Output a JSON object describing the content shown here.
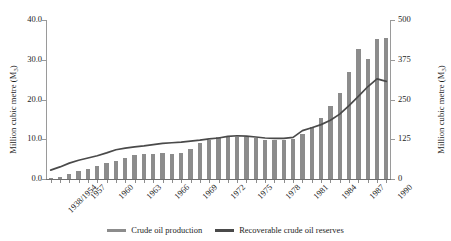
{
  "chart_data": {
    "type": "bar",
    "title": "",
    "xlabel": "",
    "ylabel": "Million cubic metre (M",
    "ylabel_sub": "3",
    "ylabel_suffix": ")",
    "y2label": "Million cubic metre (M",
    "y2label_sub": "3",
    "y2label_suffix": ")",
    "grid": false,
    "legend_position": "bottom",
    "ylim": [
      0,
      40
    ],
    "y2lim": [
      0,
      500
    ],
    "yticks": [
      "0.0",
      "10.0",
      "20.0",
      "30.0",
      "40.0"
    ],
    "ytick_values": [
      0,
      10,
      20,
      30,
      40
    ],
    "y2ticks": [
      "0",
      "125",
      "250",
      "375",
      "500"
    ],
    "y2tick_values": [
      0,
      125,
      250,
      375,
      500
    ],
    "categories": [
      "1938/1954",
      "1955",
      "1956",
      "1957",
      "1958",
      "1959",
      "1960",
      "1961",
      "1962",
      "1963",
      "1964",
      "1965",
      "1966",
      "1967",
      "1968",
      "1969",
      "1970",
      "1971",
      "1972",
      "1973",
      "1974",
      "1975",
      "1976",
      "1977",
      "1978",
      "1979",
      "1980",
      "1981",
      "1982",
      "1983",
      "1984",
      "1985",
      "1986",
      "1987",
      "1988",
      "1989",
      "1990"
    ],
    "xtick_labels": [
      "1938/1954",
      "1957",
      "1960",
      "1963",
      "1966",
      "1969",
      "1972",
      "1975",
      "1978",
      "1981",
      "1984",
      "1987",
      "1990"
    ],
    "xtick_indices": [
      0,
      3,
      6,
      9,
      12,
      15,
      18,
      21,
      24,
      27,
      30,
      33,
      36
    ],
    "series": [
      {
        "name": "Crude oil production",
        "kind": "bar",
        "axis": "left",
        "color": "#8c8c8c",
        "values": [
          0.3,
          0.6,
          1.2,
          2.0,
          2.6,
          3.3,
          4.1,
          4.6,
          5.3,
          6.0,
          6.2,
          6.4,
          6.5,
          6.4,
          6.6,
          7.6,
          9.1,
          9.8,
          10.5,
          10.6,
          10.6,
          10.5,
          10.2,
          9.8,
          9.7,
          9.8,
          10.1,
          11.4,
          13.2,
          15.3,
          18.3,
          21.6,
          26.9,
          32.8,
          30.2,
          35.3,
          35.5
        ]
      },
      {
        "name": "Recoverable crude oil reserves",
        "kind": "line",
        "axis": "right",
        "color": "#4a4a4a",
        "values": [
          28,
          38,
          50,
          59,
          66,
          73,
          82,
          92,
          97,
          101,
          104,
          108,
          112,
          114,
          116,
          119,
          122,
          126,
          129,
          134,
          136,
          135,
          132,
          129,
          128,
          128,
          131,
          152,
          161,
          171,
          185,
          204,
          231,
          260,
          290,
          315,
          307
        ]
      }
    ]
  },
  "legend": {
    "items": [
      {
        "label": "Crude oil production",
        "color": "#8c8c8c"
      },
      {
        "label": "Recoverable crude oil reserves",
        "color": "#4a4a4a"
      }
    ]
  }
}
